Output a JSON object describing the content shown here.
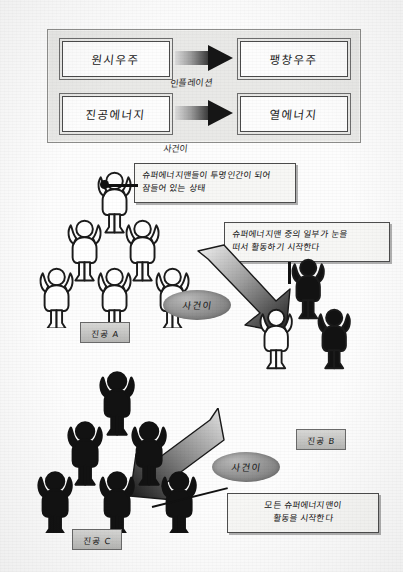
{
  "diagram": {
    "title_panel": {
      "name": "cosmology-transition-panel",
      "boxes": [
        {
          "id": "top-left",
          "label": "원시우주"
        },
        {
          "id": "top-right",
          "label": "팽창우주"
        },
        {
          "id": "bottom-left",
          "label": "진공에너지"
        },
        {
          "id": "bottom-right",
          "label": "열에너지"
        }
      ],
      "arrow_captions": {
        "top": "인플레이션",
        "bottom": "사건이"
      }
    },
    "notes": [
      {
        "id": "note-vacuum-a",
        "lines": [
          "슈퍼에너지맨들이 투명인간이 되어",
          "잠들어 있는 상태"
        ]
      },
      {
        "id": "note-vacuum-b",
        "lines": [
          "슈퍼에너지맨 중의 일부가 눈을",
          "떠서 활동하기 시작한다"
        ]
      },
      {
        "id": "note-vacuum-c",
        "lines": [
          "모든 슈퍼에너지맨이",
          "활동을 시작한다"
        ]
      }
    ],
    "transition_tags": [
      {
        "id": "tag-a-to-b",
        "label": "사건이"
      },
      {
        "id": "tag-b-to-c",
        "label": "사건이"
      }
    ],
    "stage_labels": [
      {
        "id": "stage-a",
        "label": "진공 A"
      },
      {
        "id": "stage-b",
        "label": "진공 B"
      },
      {
        "id": "stage-c",
        "label": "진공 C"
      }
    ],
    "pyramids": [
      {
        "id": "pyramid-a",
        "style": "outline",
        "rows": [
          1,
          2,
          3
        ],
        "count": 6
      },
      {
        "id": "pyramid-b",
        "style": "mixed",
        "rows": [
          1,
          2
        ],
        "count": 3
      },
      {
        "id": "pyramid-c",
        "style": "filled",
        "rows": [
          1,
          2,
          3
        ],
        "count": 6
      }
    ],
    "colors": {
      "panel_bg": "#e9e9e7",
      "box_bg": "#fdfdfd",
      "ink": "#111111",
      "arrow_dark": "#161616",
      "tag_grey": "#8f8f8f"
    }
  }
}
